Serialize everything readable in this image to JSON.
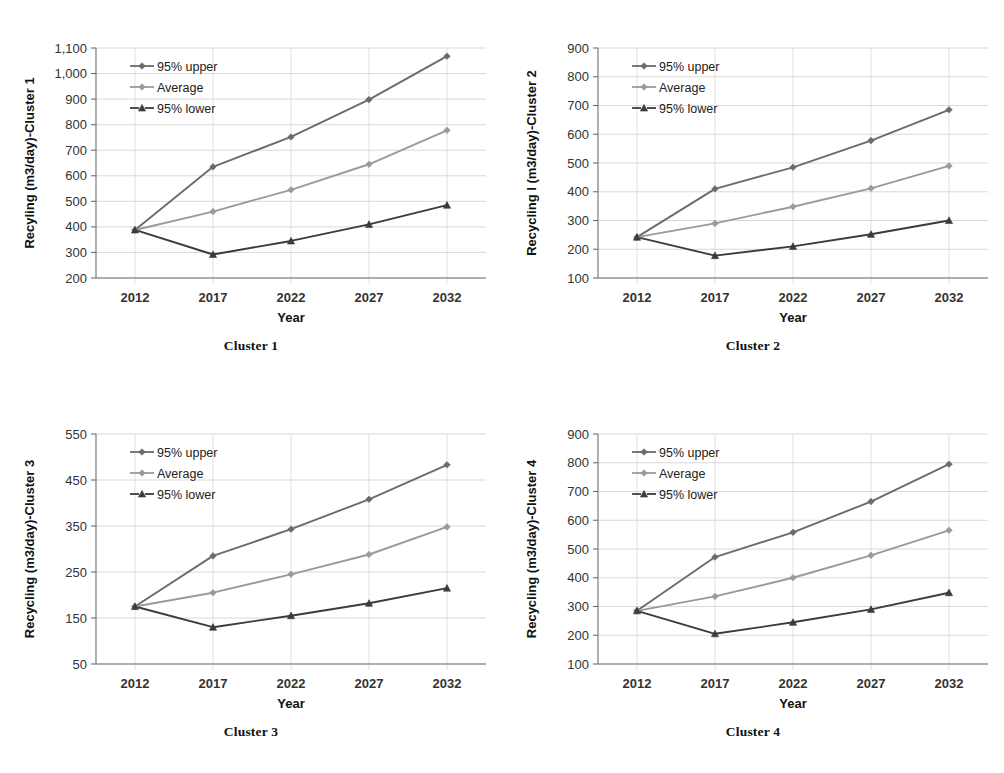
{
  "figure": {
    "panels": [
      {
        "caption": "Cluster 1",
        "chart_index": 0
      },
      {
        "caption": "Cluster 2",
        "chart_index": 1
      },
      {
        "caption": "Cluster 3",
        "chart_index": 2
      },
      {
        "caption": "Cluster 4",
        "chart_index": 3
      }
    ]
  },
  "colors": {
    "upper": "#6b6b6b",
    "average": "#9a9a9a",
    "lower": "#3b3b3b",
    "grid": "#c8c8c8",
    "axis": "#6e6e6e",
    "text": "#1a1a1a"
  },
  "chart_data": [
    {
      "type": "line",
      "title": "",
      "ylabel": "Recyling  (m3/day)-Cluster 1",
      "xlabel": "Year",
      "categories": [
        "2012",
        "2017",
        "2022",
        "2027",
        "2032"
      ],
      "x": [
        2012,
        2017,
        2022,
        2027,
        2032
      ],
      "ylim": [
        200,
        1100
      ],
      "ytick_step": 100,
      "yticks": [
        "200",
        "300",
        "400",
        "500",
        "600",
        "700",
        "800",
        "900",
        "1,000",
        "1,100"
      ],
      "ytick_values": [
        200,
        300,
        400,
        500,
        600,
        700,
        800,
        900,
        1000,
        1100
      ],
      "grid": true,
      "legend_position": "top-left",
      "series": [
        {
          "name": "95% upper",
          "values": [
            388,
            635,
            752,
            898,
            1068
          ],
          "color": "#6b6b6b",
          "marker": "diamond"
        },
        {
          "name": "Average",
          "values": [
            388,
            460,
            545,
            645,
            778
          ],
          "color": "#9a9a9a",
          "marker": "diamond"
        },
        {
          "name": "95% lower",
          "values": [
            388,
            292,
            345,
            410,
            485
          ],
          "color": "#3b3b3b",
          "marker": "triangle"
        }
      ]
    },
    {
      "type": "line",
      "title": "",
      "ylabel": "Recycling l (m3/day)-Cluster 2",
      "xlabel": "Year",
      "categories": [
        "2012",
        "2017",
        "2022",
        "2027",
        "2032"
      ],
      "x": [
        2012,
        2017,
        2022,
        2027,
        2032
      ],
      "ylim": [
        100,
        900
      ],
      "ytick_step": 100,
      "yticks": [
        "100",
        "200",
        "300",
        "400",
        "500",
        "600",
        "700",
        "800",
        "900"
      ],
      "ytick_values": [
        100,
        200,
        300,
        400,
        500,
        600,
        700,
        800,
        900
      ],
      "grid": true,
      "legend_position": "top-left",
      "series": [
        {
          "name": "95% upper",
          "values": [
            242,
            410,
            485,
            578,
            685
          ],
          "color": "#6b6b6b",
          "marker": "diamond"
        },
        {
          "name": "Average",
          "values": [
            242,
            290,
            348,
            412,
            490
          ],
          "color": "#9a9a9a",
          "marker": "diamond"
        },
        {
          "name": "95% lower",
          "values": [
            242,
            178,
            210,
            252,
            300
          ],
          "color": "#3b3b3b",
          "marker": "triangle"
        }
      ]
    },
    {
      "type": "line",
      "title": "",
      "ylabel": "Recycling  (m3/day)-Cluster 3",
      "xlabel": "Year",
      "categories": [
        "2012",
        "2017",
        "2022",
        "2027",
        "2032"
      ],
      "x": [
        2012,
        2017,
        2022,
        2027,
        2032
      ],
      "ylim": [
        50,
        550
      ],
      "ytick_step": 100,
      "yticks": [
        "50",
        "150",
        "250",
        "350",
        "450",
        "550"
      ],
      "ytick_values": [
        50,
        150,
        250,
        350,
        450,
        550
      ],
      "grid": true,
      "legend_position": "top-left",
      "series": [
        {
          "name": "95% upper",
          "values": [
            175,
            285,
            343,
            408,
            483
          ],
          "color": "#6b6b6b",
          "marker": "diamond"
        },
        {
          "name": "Average",
          "values": [
            175,
            205,
            245,
            288,
            348
          ],
          "color": "#9a9a9a",
          "marker": "diamond"
        },
        {
          "name": "95% lower",
          "values": [
            175,
            130,
            155,
            182,
            215
          ],
          "color": "#3b3b3b",
          "marker": "triangle"
        }
      ]
    },
    {
      "type": "line",
      "title": "",
      "ylabel": "Recycling (m3/day)-Cluster 4",
      "xlabel": "Year",
      "categories": [
        "2012",
        "2017",
        "2022",
        "2027",
        "2032"
      ],
      "x": [
        2012,
        2017,
        2022,
        2027,
        2032
      ],
      "ylim": [
        100,
        900
      ],
      "ytick_step": 100,
      "yticks": [
        "100",
        "200",
        "300",
        "400",
        "500",
        "600",
        "700",
        "800",
        "900"
      ],
      "ytick_values": [
        100,
        200,
        300,
        400,
        500,
        600,
        700,
        800,
        900
      ],
      "grid": true,
      "legend_position": "top-left",
      "series": [
        {
          "name": "95% upper",
          "values": [
            285,
            472,
            558,
            665,
            795
          ],
          "color": "#6b6b6b",
          "marker": "diamond"
        },
        {
          "name": "Average",
          "values": [
            285,
            335,
            400,
            478,
            565
          ],
          "color": "#9a9a9a",
          "marker": "diamond"
        },
        {
          "name": "95% lower",
          "values": [
            285,
            205,
            245,
            290,
            348
          ],
          "color": "#3b3b3b",
          "marker": "triangle"
        }
      ]
    }
  ]
}
